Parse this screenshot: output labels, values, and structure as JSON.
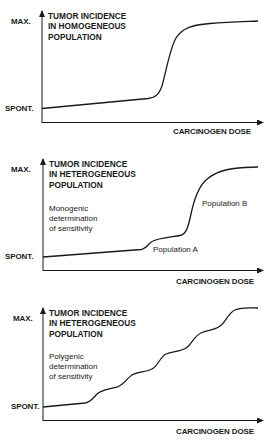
{
  "panels": [
    {
      "title_lines": [
        "TUMOR INCIDENCE",
        "IN HOMOGENEOUS",
        "POPULATION"
      ],
      "y_max_label": "MAX.",
      "y_min_label": "SPONT.",
      "x_label": "CARCINOGEN DOSE",
      "note_lines": [],
      "curve_labels": []
    },
    {
      "title_lines": [
        "TUMOR INCIDENCE",
        "IN HETEROGENEOUS",
        "POPULATION"
      ],
      "y_max_label": "MAX.",
      "y_min_label": "SPONT.",
      "x_label": "CARCINOGEN DOSE",
      "note_lines": [
        "Monogenic",
        "determination",
        "of sensitivity"
      ],
      "curve_labels": [
        "Population A",
        "Population B"
      ]
    },
    {
      "title_lines": [
        "TUMOR INCIDENCE",
        "IN HETEROGENEOUS",
        "POPULATION"
      ],
      "y_max_label": "MAX.",
      "y_min_label": "SPONT.",
      "x_label": "CARCINOGEN DOSE",
      "note_lines": [
        "Polygenic",
        "determination",
        "of sensitivity"
      ],
      "curve_labels": []
    }
  ],
  "colors": {
    "ink": "#1a1a1a",
    "background": "#ffffff"
  }
}
